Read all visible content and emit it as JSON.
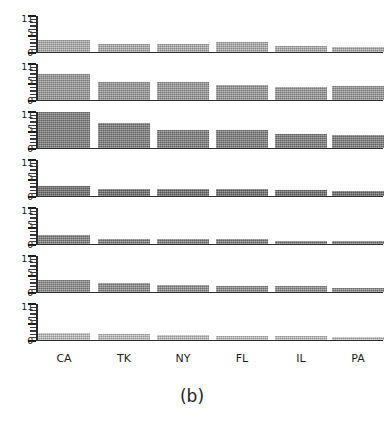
{
  "figure": {
    "caption": "(b)",
    "x_labels": [
      "CA",
      "TK",
      "NY",
      "FL",
      "IL",
      "PA"
    ],
    "y_tick_labels": [
      "11",
      "5",
      "0"
    ]
  },
  "chart_data": {
    "type": "bar",
    "title": "",
    "subtitle": "",
    "caption": "(b)",
    "xlabel": "",
    "ylabel": "",
    "ylim": [
      0,
      11
    ],
    "grid": false,
    "legend": "none",
    "layout": "small-multiples, 7 stacked panels sharing one x axis",
    "axis_tick_values": [
      0,
      5,
      11
    ],
    "categories": [
      "CA",
      "TK",
      "NY",
      "FL",
      "IL",
      "PA"
    ],
    "panels": [
      {
        "index": 1,
        "values": [
          3.5,
          2.3,
          2.4,
          3.0,
          1.6,
          1.5
        ],
        "color": "#b0b0b0"
      },
      {
        "index": 2,
        "values": [
          8.0,
          5.3,
          5.3,
          4.6,
          3.8,
          4.2
        ],
        "color": "#9a9a9a"
      },
      {
        "index": 3,
        "values": [
          11.0,
          7.5,
          5.5,
          5.6,
          4.3,
          4.0
        ],
        "color": "#7d7d7d"
      },
      {
        "index": 4,
        "values": [
          3.0,
          2.0,
          1.9,
          1.9,
          1.7,
          1.4
        ],
        "color": "#6e6e6e"
      },
      {
        "index": 5,
        "values": [
          2.6,
          1.5,
          1.3,
          1.3,
          0.9,
          0.9
        ],
        "color": "#808080"
      },
      {
        "index": 6,
        "values": [
          3.5,
          2.7,
          1.9,
          1.8,
          1.6,
          1.1
        ],
        "color": "#8d8d8d"
      },
      {
        "index": 7,
        "values": [
          2.2,
          1.8,
          1.5,
          1.2,
          1.0,
          0.7
        ],
        "color": "#c2c2c2"
      }
    ]
  }
}
